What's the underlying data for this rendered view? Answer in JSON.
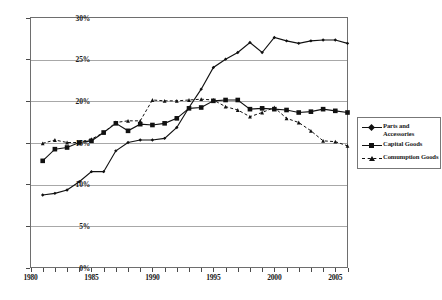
{
  "chart_data": {
    "type": "line",
    "title": "",
    "xlabel": "",
    "ylabel": "",
    "xlim": [
      1980,
      2006
    ],
    "ylim": [
      0,
      30
    ],
    "ytick_labels": [
      "0%",
      "5%",
      "10%",
      "15%",
      "20%",
      "25%",
      "30%"
    ],
    "ytick_values": [
      0,
      5,
      10,
      15,
      20,
      25,
      30
    ],
    "xtick_labels": [
      "1980",
      "1985",
      "1990",
      "1995",
      "2000",
      "2005"
    ],
    "xtick_values": [
      1980,
      1985,
      1990,
      1995,
      2000,
      2005
    ],
    "x": [
      1981,
      1982,
      1983,
      1984,
      1985,
      1986,
      1987,
      1988,
      1989,
      1990,
      1991,
      1992,
      1993,
      1994,
      1995,
      1996,
      1997,
      1998,
      1999,
      2000,
      2001,
      2002,
      2003,
      2004,
      2005,
      2006
    ],
    "grid": "horizontal",
    "legend_position": "right",
    "series": [
      {
        "name": "Parts and Accessories",
        "marker": "diamond",
        "linestyle": "solid",
        "color": "#111111",
        "values": [
          8.7,
          8.9,
          9.3,
          10.3,
          11.5,
          11.5,
          14.0,
          15.0,
          15.3,
          15.3,
          15.5,
          16.8,
          19.2,
          21.4,
          24.0,
          25.0,
          25.8,
          27.0,
          25.8,
          27.6,
          27.2,
          26.9,
          27.2,
          27.3,
          27.3,
          26.9
        ]
      },
      {
        "name": "Capital Goods",
        "marker": "square",
        "linestyle": "solid",
        "color": "#111111",
        "values": [
          12.8,
          14.2,
          14.4,
          15.0,
          15.2,
          16.2,
          17.3,
          16.4,
          17.2,
          17.1,
          17.3,
          17.9,
          19.1,
          19.2,
          20.0,
          20.1,
          20.1,
          19.0,
          19.1,
          19.0,
          18.9,
          18.6,
          18.7,
          19.0,
          18.8,
          18.6
        ]
      },
      {
        "name": "Comumption Goods",
        "marker": "triangle",
        "linestyle": "dashed",
        "color": "#111111",
        "values": [
          14.9,
          15.3,
          15.0,
          15.0,
          15.4,
          16.2,
          17.4,
          17.6,
          17.6,
          20.1,
          20.0,
          20.0,
          20.1,
          20.2,
          20.1,
          19.3,
          18.9,
          18.1,
          18.6,
          19.2,
          17.9,
          17.4,
          16.4,
          15.2,
          15.1,
          14.6
        ]
      }
    ]
  },
  "legend": {
    "entries": [
      {
        "label": "Parts and\nAccessories",
        "symbol": "diamond-line"
      },
      {
        "label": "Capital Goods",
        "symbol": "square-line"
      },
      {
        "label": "Comumption Goods",
        "symbol": "triangle-dashed-line"
      }
    ]
  },
  "caption": {
    "text": ""
  }
}
